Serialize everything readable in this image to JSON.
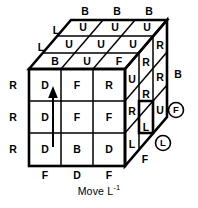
{
  "diagram": {
    "caption_prefix": "Move L",
    "caption_exponent": "-1",
    "caption_full": "Move L-1",
    "colors": {
      "stroke": "#000000",
      "face": "#ffffff",
      "text": "#000000"
    },
    "front_face": {
      "name": "front-face",
      "rows": [
        [
          "D",
          "F",
          "R"
        ],
        [
          "D",
          "F",
          "F"
        ],
        [
          "D",
          "B",
          "D"
        ]
      ]
    },
    "top_face": {
      "name": "top-face",
      "rows": [
        [
          "U",
          "U",
          "U"
        ],
        [
          "U",
          "U",
          "U"
        ],
        [
          "B",
          "U",
          "F"
        ]
      ]
    },
    "right_face": {
      "name": "right-face",
      "rows": [
        [
          "U",
          "R",
          "R"
        ],
        [
          "R",
          "R",
          "R"
        ],
        [
          "L",
          "L",
          "U"
        ]
      ]
    },
    "edge_labels": {
      "top": [
        "B",
        "B",
        "B"
      ],
      "top_left": [
        "L",
        "L"
      ],
      "left": [
        "R",
        "R",
        "R"
      ],
      "bottom": [
        "F",
        "D",
        "F"
      ],
      "right": [
        "B"
      ]
    },
    "circled_labels": [
      {
        "text": "F",
        "name": "circled-front-label"
      },
      {
        "text": "L",
        "name": "circled-left-label"
      }
    ],
    "arrow": {
      "name": "rotation-arrow",
      "direction": "up",
      "column": 1
    }
  }
}
